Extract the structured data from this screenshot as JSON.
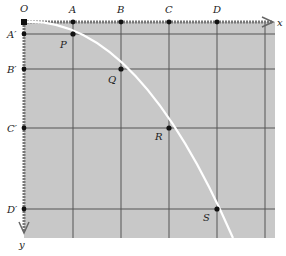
{
  "diagram": {
    "colors": {
      "background": "#ffffff",
      "panel": "#c8c8c8",
      "grid": "#555555",
      "axis": "#777777",
      "curve": "#ffffff",
      "point": "#111111",
      "label": "#222222"
    },
    "origin": {
      "label": "O",
      "x": 24,
      "y": 22
    },
    "x_axis": {
      "label": "x"
    },
    "y_axis": {
      "label": "y"
    },
    "x_marks": [
      {
        "label": "A",
        "x": 73
      },
      {
        "label": "B",
        "x": 121
      },
      {
        "label": "C",
        "x": 169
      },
      {
        "label": "D",
        "x": 217
      }
    ],
    "y_marks": [
      {
        "label": "A′",
        "y": 34
      },
      {
        "label": "B′",
        "y": 69
      },
      {
        "label": "C′",
        "y": 128
      },
      {
        "label": "D′",
        "y": 209
      }
    ],
    "points": [
      {
        "label": "P",
        "x": 73,
        "y": 34
      },
      {
        "label": "Q",
        "x": 121,
        "y": 69
      },
      {
        "label": "R",
        "x": 169,
        "y": 128
      },
      {
        "label": "S",
        "x": 217,
        "y": 209
      }
    ]
  }
}
